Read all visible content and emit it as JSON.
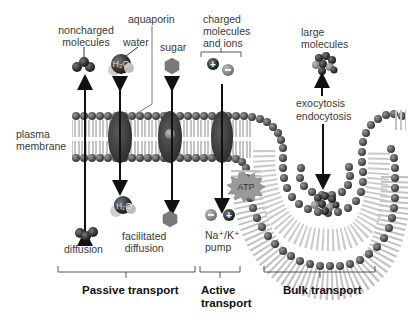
{
  "labels": {
    "noncharged": "noncharged\nmolecules",
    "noncharged_l1": "noncharged",
    "noncharged_l2": "molecules",
    "aquaporin": "aquaporin",
    "water": "water",
    "sugar": "sugar",
    "charged_l1": "charged",
    "charged_l2": "molecules",
    "charged_l3": "and ions",
    "large_l1": "large",
    "large_l2": "molecules",
    "exocytosis": "exocytosis",
    "endocytosis": "endocytosis",
    "plasma_l1": "plasma",
    "plasma_l2": "membrane",
    "atp": "ATP",
    "h2o_top": "H₂O",
    "h2o_bottom": "H₂O",
    "diffusion": "diffusion",
    "facilitated_l1": "facilitated",
    "facilitated_l2": "diffusion",
    "pump_l1": "Na⁺/K⁺",
    "pump_l2": "pump",
    "plus": "+",
    "minus": "–"
  },
  "categories": [
    {
      "name": "Passive transport",
      "l1": "Passive transport"
    },
    {
      "name": "Active transport",
      "l1": "Active",
      "l2": "transport"
    },
    {
      "name": "Bulk transport",
      "l1": "Bulk transport"
    }
  ],
  "colors": {
    "lipid_head": "#4a4a4a",
    "lipid_tail": "#b8b8b8",
    "protein": "#3c3c3c",
    "sugar": "#7a7a7a",
    "arrow": "#111111"
  }
}
